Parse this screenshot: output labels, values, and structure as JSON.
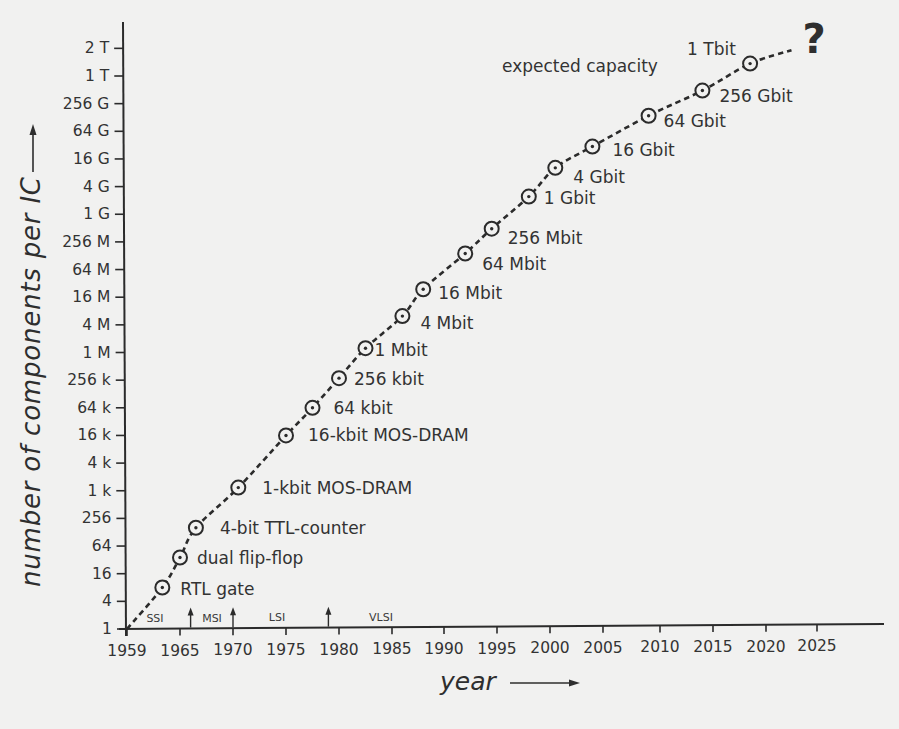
{
  "chart_data": {
    "type": "line",
    "title": "",
    "xlabel": "year",
    "ylabel": "number of components per IC",
    "x_scale": "linear",
    "y_scale": "log",
    "xlim": [
      1959,
      2028
    ],
    "ylim": [
      1,
      2199023255552
    ],
    "grid": false,
    "legend": null,
    "x_ticks": [
      "1959",
      "1965",
      "1970",
      "1975",
      "1980",
      "1985",
      "1990",
      "1995",
      "2000",
      "2005",
      "2010",
      "2015",
      "2020",
      "2025"
    ],
    "y_ticks": [
      "1",
      "4",
      "16",
      "64",
      "256",
      "1 k",
      "4 k",
      "16 k",
      "64 k",
      "256 k",
      "1 M",
      "4 M",
      "16 M",
      "64 M",
      "256 M",
      "1 G",
      "4 G",
      "16 G",
      "64 G",
      "256 G",
      "1 T",
      "2 T"
    ],
    "y_tick_values": [
      1,
      4,
      16,
      64,
      256,
      1024,
      4096,
      16384,
      65536,
      262144,
      1048576,
      4194304,
      16777216,
      67108864,
      268435456,
      1073741824,
      4294967296,
      17179869184,
      68719476736,
      274877906944,
      1099511627776,
      2199023255552
    ],
    "series": [
      {
        "name": "expected capacity",
        "line_style": "dashed",
        "marker": "circle-with-dot",
        "line_start": {
          "x": 1959,
          "y": 1
        },
        "line_end": {
          "x": 2022.5,
          "y": 2100000000000
        },
        "points": [
          {
            "label": "RTL gate",
            "x": 1963,
            "y": 8
          },
          {
            "label": "dual flip-flop",
            "x": 1965,
            "y": 36
          },
          {
            "label": "4-bit TTL-counter",
            "x": 1966.5,
            "y": 160
          },
          {
            "label": "1-kbit MOS-DRAM",
            "x": 1970.5,
            "y": 1200
          },
          {
            "label": "16-kbit MOS-DRAM",
            "x": 1975,
            "y": 16384
          },
          {
            "label": "64 kbit",
            "x": 1977.5,
            "y": 65536
          },
          {
            "label": "256 kbit",
            "x": 1980,
            "y": 290000
          },
          {
            "label": "1 Mbit",
            "x": 1982.5,
            "y": 1300000
          },
          {
            "label": "4 Mbit",
            "x": 1986,
            "y": 6500000
          },
          {
            "label": "16 Mbit",
            "x": 1988,
            "y": 25000000
          },
          {
            "label": "64 Mbit",
            "x": 1992,
            "y": 150000000
          },
          {
            "label": "256 Mbit",
            "x": 1994.5,
            "y": 520000000
          },
          {
            "label": "1 Gbit",
            "x": 1998,
            "y": 2600000000
          },
          {
            "label": "4 Gbit",
            "x": 2000.5,
            "y": 11000000000
          },
          {
            "label": "16 Gbit",
            "x": 2004,
            "y": 32000000000
          },
          {
            "label": "64 Gbit",
            "x": 2009,
            "y": 150000000000
          },
          {
            "label": "256 Gbit",
            "x": 2014,
            "y": 530000000000
          },
          {
            "label": "1 Tbit",
            "x": 2018.5,
            "y": 1500000000000
          }
        ]
      }
    ],
    "annotations": [
      {
        "text": "expected capacity"
      },
      {
        "text": "?"
      }
    ],
    "eras": [
      {
        "label": "SSI"
      },
      {
        "label": "MSI"
      },
      {
        "label": "LSI"
      },
      {
        "label": "VLSI"
      }
    ],
    "era_boundaries": [
      1966,
      1970,
      1979
    ],
    "colors": {
      "ink": "#2b2b2b",
      "text": "#333333",
      "background": "#f1f1f0"
    }
  }
}
